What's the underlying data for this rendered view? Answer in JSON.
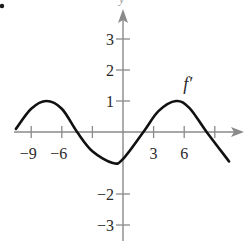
{
  "chart_data": {
    "type": "line",
    "title": "",
    "xlabel": "x",
    "ylabel": "y",
    "curve_label": "f′",
    "x_ticks": [
      -9,
      -6,
      -3,
      3,
      6,
      9
    ],
    "x_tick_labels": [
      "−9",
      "−6",
      "3",
      "6"
    ],
    "x_labeled_ticks": [
      -9,
      -6,
      3,
      6
    ],
    "y_ticks": [
      3,
      2,
      1,
      -2,
      -3
    ],
    "y_tick_labels": [
      "3",
      "2",
      "1",
      "−2",
      "−3"
    ],
    "y_labeled_ticks": [
      3,
      2,
      1,
      -2,
      -3
    ],
    "xlim": [
      -10.5,
      10.5
    ],
    "ylim": [
      -3.5,
      3.5
    ],
    "grid": false,
    "series": [
      {
        "name": "f′",
        "x": [
          -10.5,
          -9,
          -7.5,
          -6,
          -4.5,
          -3,
          -1,
          0,
          2,
          3.5,
          5.2,
          6.5,
          8.2,
          10.4
        ],
        "values": [
          0.1,
          0.75,
          1.0,
          0.75,
          0.0,
          -0.62,
          -1.0,
          -0.87,
          0.0,
          0.68,
          1.0,
          0.78,
          0.0,
          -0.95
        ]
      }
    ],
    "annotations": [
      {
        "text": "f′",
        "x": 6.3,
        "y": 1.6
      }
    ]
  },
  "marker_bullet": "•"
}
